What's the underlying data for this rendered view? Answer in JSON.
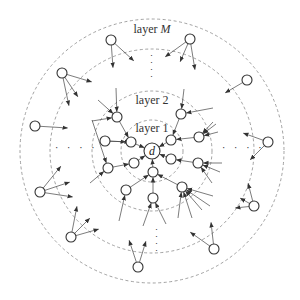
{
  "diagram": {
    "center": {
      "x": 152,
      "y": 151
    },
    "rings": [
      {
        "name": "layer 1",
        "r": 31
      },
      {
        "name": "layer 2",
        "r": 60
      },
      {
        "name": "ring 3",
        "r": 102
      },
      {
        "name": "layer M",
        "r": 132
      }
    ],
    "labels": {
      "layer_m_prefix": "layer ",
      "layer_m_var": "M",
      "layer_2": "layer 2",
      "layer_1": "layer 1",
      "destination": "d"
    },
    "ellipsis_h": "· · · ·",
    "ellipsis_v": "·\n·\n·\n·"
  }
}
